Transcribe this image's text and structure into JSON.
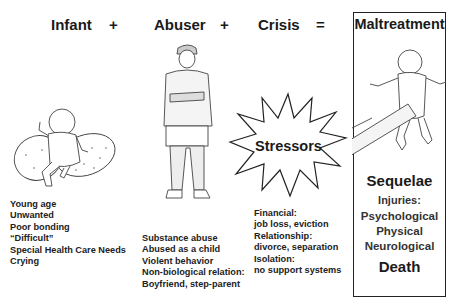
{
  "equation": {
    "terms": [
      {
        "label": "Infant",
        "operator": "+"
      },
      {
        "label": "Abuser",
        "operator": "+"
      },
      {
        "label": "Crisis",
        "operator": "="
      },
      {
        "label": "Maltreatment",
        "operator": ""
      }
    ]
  },
  "infant": {
    "illustration": "baby-on-nursing-pillow",
    "factors": [
      "Young age",
      "Unwanted",
      "Poor bonding",
      "“Difficult”",
      "Special Health Care Needs",
      "Crying"
    ]
  },
  "abuser": {
    "illustration": "standing-man-arms-crossed",
    "factors": [
      "Substance abuse",
      "Abused as a child",
      "Violent behavior",
      "Non-biological relation:",
      "Boyfriend, step-parent"
    ]
  },
  "crisis": {
    "starburst_label": "Stressors",
    "factors": [
      "Financial:",
      "job loss, eviction",
      "Relationship:",
      "divorce, separation",
      "Isolation:",
      "no support systems"
    ]
  },
  "maltreatment": {
    "illustration": "infant-held-by-arm",
    "sequelae_title": "Sequelae",
    "injuries_label": "Injuries:",
    "injuries": [
      "Psychological",
      "Physical",
      "Neurological"
    ],
    "outcome": "Death"
  },
  "colors": {
    "ink": "#1a1a1a",
    "background": "#ffffff",
    "line": "#555555"
  }
}
